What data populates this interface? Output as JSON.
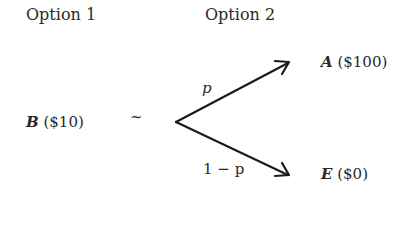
{
  "headers": {
    "option1": "Option 1",
    "option2": "Option 2"
  },
  "option1": {
    "symbol": "B",
    "value": "($10)"
  },
  "relation": "~",
  "option2": {
    "branches": [
      {
        "probability": "p",
        "symbol": "A",
        "value": "($100)"
      },
      {
        "probability": "1 − p",
        "symbol": "E",
        "value": "($0)"
      }
    ]
  },
  "colors": {
    "text": "#2a2a2a",
    "arrow": "#1a1a1a",
    "background": "#ffffff"
  }
}
